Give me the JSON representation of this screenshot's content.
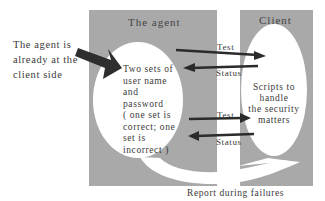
{
  "diagram": {
    "side_note": [
      "The agent is",
      "already at the",
      "client side"
    ],
    "agent_box": {
      "title": "The agent",
      "content": [
        "Two sets of",
        "user name",
        "and",
        "password",
        "( one set is",
        "correct; one",
        "set is",
        "incorrect )"
      ]
    },
    "client_box": {
      "title": "Client",
      "content": [
        "Scripts to",
        "handle",
        "the security",
        "matters"
      ]
    },
    "arrows": [
      {
        "label": "Test",
        "direction": "agent-to-client"
      },
      {
        "label": "Status",
        "direction": "client-to-agent"
      },
      {
        "label": "Test",
        "direction": "agent-to-client"
      },
      {
        "label": "Status",
        "direction": "client-to-agent"
      }
    ],
    "report_label": "Report during failures",
    "colors": {
      "box_fill": "#a9a9a9",
      "ellipse_fill": "#ffffff",
      "arrow": "#2b2b2b"
    }
  }
}
